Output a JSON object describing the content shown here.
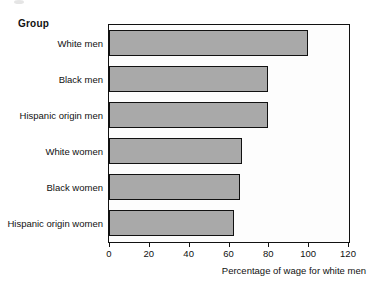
{
  "figure": {
    "group_header": "Group",
    "x_caption": "Percentage of wage for white men",
    "bar_fill_color": "#a9a9a9",
    "bar_border_color": "#111111",
    "axis_color": "#111111",
    "background_color": "#ffffff"
  },
  "chart_data": {
    "type": "bar",
    "orientation": "horizontal",
    "title": "",
    "subtitle": "",
    "xlabel": "Percentage of wage for white men",
    "ylabel": "Group",
    "categories": [
      "White men",
      "Black men",
      "Hispanic origin men",
      "White women",
      "Black women",
      "Hispanic origin women"
    ],
    "values": [
      100,
      80,
      80,
      67,
      66,
      63
    ],
    "xlim": [
      0,
      120
    ],
    "xticks": [
      0,
      20,
      40,
      60,
      80,
      100,
      120
    ],
    "xtick_labels": [
      "0",
      "20",
      "40",
      "60",
      "80",
      "100",
      "120"
    ],
    "grid": false,
    "legend": false,
    "legend_position": "none"
  }
}
